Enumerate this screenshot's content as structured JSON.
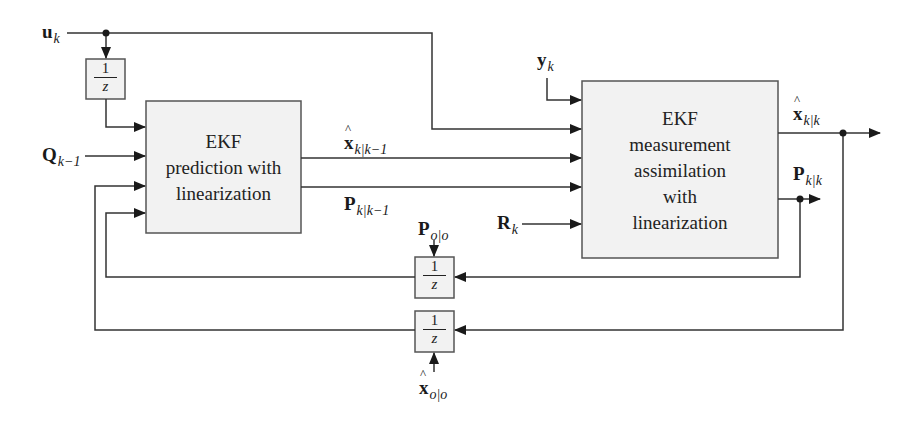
{
  "diagram": {
    "type": "block-diagram",
    "title": "",
    "colors": {
      "line": "#333333",
      "block_fill": "#f2f2f2",
      "block_border": "#555555"
    },
    "blocks": {
      "prediction": {
        "lines": [
          "EKF",
          "prediction with",
          "linearization"
        ]
      },
      "measurement": {
        "lines": [
          "EKF",
          "measurement",
          "assimilation",
          "with",
          "linearization"
        ]
      },
      "delay_u": {
        "num": "1",
        "den": "z"
      },
      "delay_p": {
        "num": "1",
        "den": "z"
      },
      "delay_x": {
        "num": "1",
        "den": "z"
      }
    },
    "signals": {
      "u": {
        "base": "u",
        "sub": "k"
      },
      "q": {
        "base": "Q",
        "sub": "k−1"
      },
      "x_pred": {
        "base": "x",
        "sub": "k|k−1",
        "hat": true
      },
      "p_pred": {
        "base": "P",
        "sub": "k|k−1"
      },
      "y": {
        "base": "y",
        "sub": "k"
      },
      "r": {
        "base": "R",
        "sub": "k"
      },
      "x_upd": {
        "base": "x",
        "sub": "k|k",
        "hat": true
      },
      "p_upd": {
        "base": "P",
        "sub": "k|k"
      },
      "p0": {
        "base": "P",
        "sub": "o|o"
      },
      "x0": {
        "base": "x",
        "sub": "o|o",
        "hat": true
      }
    }
  }
}
